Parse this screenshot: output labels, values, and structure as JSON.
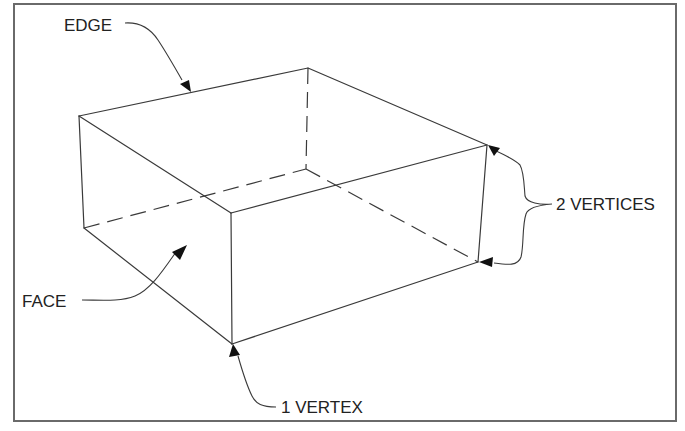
{
  "diagram": {
    "title": "",
    "type": "isometric-box-terminology",
    "labels": {
      "edge": "EDGE",
      "face": "FACE",
      "vertex": "1 VERTEX",
      "vertices": "2 VERTICES"
    },
    "colors": {
      "line": "#3a3a3a",
      "frame": "#6a6a6a",
      "text": "#222222",
      "arrow": "#111111",
      "background": "#ffffff"
    },
    "vertices": {
      "top_left": [
        79,
        116
      ],
      "top_back": [
        308,
        68
      ],
      "top_right": [
        487,
        145
      ],
      "top_near": [
        231,
        213
      ],
      "bottom_left": [
        84,
        228
      ],
      "bottom_near": [
        232,
        344
      ],
      "bottom_right": [
        478,
        262
      ],
      "bottom_back_hidden": [
        306,
        169
      ]
    },
    "visible_edges": [
      [
        "top_left",
        "top_back"
      ],
      [
        "top_back",
        "top_right"
      ],
      [
        "top_left",
        "top_near"
      ],
      [
        "top_near",
        "top_right"
      ],
      [
        "top_left",
        "bottom_left"
      ],
      [
        "top_near",
        "bottom_near"
      ],
      [
        "top_right",
        "bottom_right"
      ],
      [
        "bottom_left",
        "bottom_near"
      ],
      [
        "bottom_near",
        "bottom_right"
      ]
    ],
    "hidden_edges": [
      [
        "top_back",
        "bottom_back_hidden"
      ],
      [
        "bottom_left",
        "bottom_back_hidden"
      ],
      [
        "bottom_back_hidden",
        "bottom_right"
      ]
    ]
  }
}
